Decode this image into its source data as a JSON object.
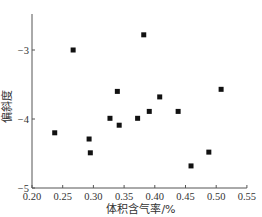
{
  "chart_data": {
    "type": "scatter",
    "title": "",
    "xlabel": "体积含气率/%",
    "ylabel": "偏斜度",
    "xlim": [
      0.2,
      0.55
    ],
    "ylim": [
      -5,
      -2.5
    ],
    "xticks": [
      "0.20",
      "0.25",
      "0.30",
      "0.35",
      "0.40",
      "0.45",
      "0.50",
      "0.55"
    ],
    "yticks": [
      "-3",
      "-4",
      "-5"
    ],
    "grid": false,
    "legend": null,
    "marker": "square",
    "series": [
      {
        "name": "偏斜度",
        "points": [
          {
            "x": 0.237,
            "y": -4.2
          },
          {
            "x": 0.267,
            "y": -3.0
          },
          {
            "x": 0.293,
            "y": -4.29
          },
          {
            "x": 0.295,
            "y": -4.49
          },
          {
            "x": 0.327,
            "y": -3.99
          },
          {
            "x": 0.339,
            "y": -3.6
          },
          {
            "x": 0.342,
            "y": -4.09
          },
          {
            "x": 0.372,
            "y": -3.99
          },
          {
            "x": 0.382,
            "y": -2.78
          },
          {
            "x": 0.391,
            "y": -3.89
          },
          {
            "x": 0.408,
            "y": -3.68
          },
          {
            "x": 0.438,
            "y": -3.89
          },
          {
            "x": 0.459,
            "y": -4.68
          },
          {
            "x": 0.488,
            "y": -4.48
          },
          {
            "x": 0.508,
            "y": -3.57
          }
        ]
      }
    ]
  },
  "style": {
    "axis_color": "#555555",
    "marker_color": "#111111"
  }
}
